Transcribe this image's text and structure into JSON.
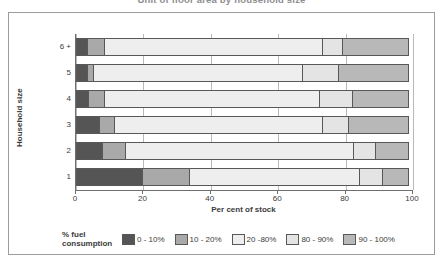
{
  "chart_data": {
    "type": "bar",
    "orientation": "horizontal",
    "stacked": true,
    "stack_total": 100,
    "title": "Unit of floor area by household size",
    "xlabel": "Per cent of stock",
    "ylabel": "Household size",
    "xlim": [
      0,
      100
    ],
    "xticks": [
      0,
      20,
      40,
      60,
      80,
      100
    ],
    "xtick_labels": [
      "0",
      "20",
      "40",
      "60",
      "80",
      "100"
    ],
    "grid": true,
    "grid_axis": "x",
    "legend_title": "% fuel\nconsumption",
    "legend_position": "bottom",
    "categories": [
      "1",
      "2",
      "3",
      "4",
      "5",
      "6 +"
    ],
    "category_order_top_to_bottom": [
      "6 +",
      "5",
      "4",
      "3",
      "2",
      "1"
    ],
    "series": [
      {
        "name": "0 - 10%",
        "color": "#555555",
        "values": [
          20.0,
          8.0,
          7.0,
          4.0,
          3.5,
          3.5
        ]
      },
      {
        "name": "10 - 20%",
        "color": "#a9a9a9",
        "values": [
          14.0,
          7.0,
          5.0,
          5.0,
          2.0,
          5.5
        ]
      },
      {
        "name": "20 -80%",
        "color": "#eeeeee",
        "values": [
          51.0,
          68.0,
          62.0,
          64.0,
          62.5,
          65.0
        ]
      },
      {
        "name": "80 - 90%",
        "color": "#e4e4e4",
        "values": [
          7.0,
          7.0,
          8.0,
          10.0,
          11.0,
          6.0
        ]
      },
      {
        "name": "90 - 100%",
        "color": "#b8b8b8",
        "values": [
          8.0,
          10.0,
          18.0,
          17.0,
          21.0,
          20.0
        ]
      }
    ]
  },
  "axes": {
    "y_title": "Household size",
    "x_title": "Per cent of stock",
    "x_tick_labels": [
      "0",
      "20",
      "40",
      "60",
      "80",
      "100"
    ],
    "y_tick_labels": [
      "6 +",
      "5",
      "4",
      "3",
      "2",
      "1"
    ]
  },
  "legend": {
    "title_line1": "% fuel",
    "title_line2": "consumption",
    "entries": [
      {
        "label": "0 - 10%",
        "color": "#555555"
      },
      {
        "label": "10 - 20%",
        "color": "#a9a9a9"
      },
      {
        "label": "20 -80%",
        "color": "#eeeeee"
      },
      {
        "label": "80 - 90%",
        "color": "#e4e4e4"
      },
      {
        "label": "90 - 100%",
        "color": "#b8b8b8"
      }
    ]
  },
  "colors": {
    "frame": "#9c9c9c",
    "axis": "#6f6f6f",
    "gridline": "#b9b9b9",
    "segment_border": "#585858",
    "text": "#3b3b3b",
    "title_text": "#8e8e8e",
    "background": "#ffffff"
  }
}
